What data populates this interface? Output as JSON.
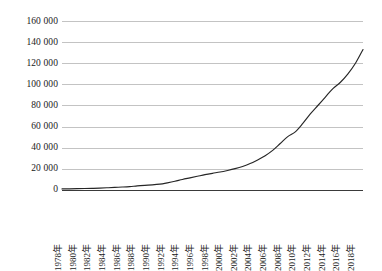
{
  "chart_data": {
    "type": "line",
    "title": "",
    "subtitle": "",
    "xlabel": "",
    "ylabel": "",
    "grid": true,
    "legend": null,
    "legend_position": "none",
    "line_color": "#262626",
    "grid_color": "#c3c3c3",
    "axis_color": "#3a3a3a",
    "ylim": [
      0,
      160000
    ],
    "ytick_labels": [
      "160 000",
      "140 000",
      "120 000",
      "100 000",
      "80 000",
      "60 000",
      "40 000",
      "20 000",
      "0"
    ],
    "ytick_values": [
      160000,
      140000,
      120000,
      100000,
      80000,
      60000,
      40000,
      20000,
      0
    ],
    "xtick_labels": [
      "1978年",
      "1980年",
      "1982年",
      "1984年",
      "1986年",
      "1988年",
      "1990年",
      "1992年",
      "1994年",
      "1996年",
      "1998年",
      "2000年",
      "2002年",
      "2004年",
      "2006年",
      "2008年",
      "2010年",
      "2012年",
      "2014年",
      "2016年",
      "2018年"
    ],
    "x": [
      1978,
      1979,
      1980,
      1981,
      1982,
      1983,
      1984,
      1985,
      1986,
      1987,
      1988,
      1989,
      1990,
      1991,
      1992,
      1993,
      1994,
      1995,
      1996,
      1997,
      1998,
      1999,
      2000,
      2001,
      2002,
      2003,
      2004,
      2005,
      2006,
      2007,
      2008,
      2009,
      2010,
      2011,
      2012,
      2013,
      2014,
      2015,
      2016,
      2017,
      2018
    ],
    "values": [
      1000,
      1100,
      1250,
      1400,
      1550,
      1750,
      2100,
      2500,
      2800,
      3200,
      3900,
      4400,
      4800,
      5500,
      6800,
      8300,
      10000,
      11500,
      13000,
      14500,
      15800,
      17000,
      18500,
      20200,
      22300,
      25000,
      28500,
      32500,
      37500,
      44000,
      50500,
      55000,
      63000,
      72000,
      80000,
      88000,
      96000,
      102000,
      110000,
      120000,
      133000
    ],
    "series_name": "GDP"
  }
}
